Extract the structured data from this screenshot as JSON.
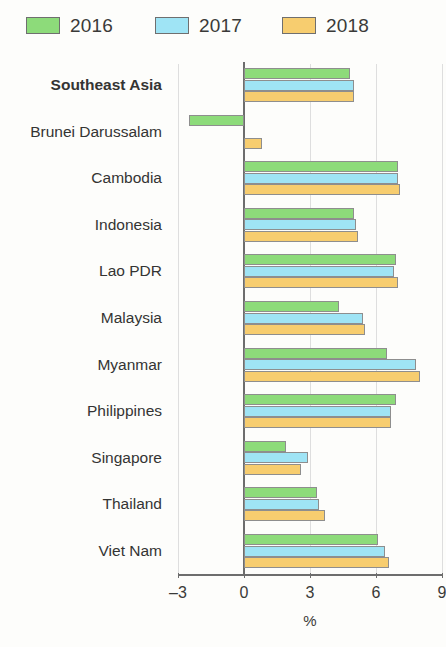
{
  "legend": {
    "items": [
      {
        "label": "2016",
        "color": "#8ddb7a"
      },
      {
        "label": "2017",
        "color": "#9fe4f5"
      },
      {
        "label": "2018",
        "color": "#f7cd6f"
      }
    ]
  },
  "axis": {
    "x_title": "%",
    "ticks": [
      "–3",
      "0",
      "3",
      "6",
      "9"
    ]
  },
  "chart_data": {
    "type": "bar",
    "orientation": "horizontal",
    "title": "",
    "subtitle": "",
    "xlabel": "%",
    "ylabel": "",
    "xlim": [
      -3,
      9
    ],
    "xticks": [
      -3,
      0,
      3,
      6,
      9
    ],
    "grid": true,
    "legend_position": "top-left",
    "categories": [
      "Southeast Asia",
      "Brunei Darussalam",
      "Cambodia",
      "Indonesia",
      "Lao PDR",
      "Malaysia",
      "Myanmar",
      "Philippines",
      "Singapore",
      "Thailand",
      "Viet Nam"
    ],
    "highlighted_category": "Southeast Asia",
    "series": [
      {
        "name": "2016",
        "color": "#8ddb7a",
        "values": [
          4.8,
          -2.5,
          7.0,
          5.0,
          6.9,
          4.3,
          6.5,
          6.9,
          1.9,
          3.3,
          6.1
        ]
      },
      {
        "name": "2017",
        "color": "#9fe4f5",
        "values": [
          5.0,
          0.0,
          7.0,
          5.1,
          6.8,
          5.4,
          7.8,
          6.7,
          2.9,
          3.4,
          6.4
        ]
      },
      {
        "name": "2018",
        "color": "#f7cd6f",
        "values": [
          5.0,
          0.8,
          7.1,
          5.2,
          7.0,
          5.5,
          8.0,
          6.7,
          2.6,
          3.7,
          6.6
        ]
      }
    ]
  }
}
